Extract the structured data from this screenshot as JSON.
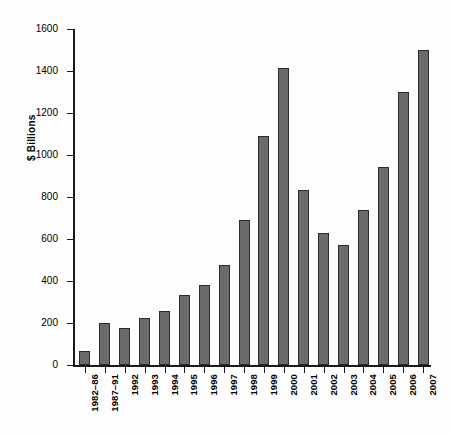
{
  "chart_data": {
    "type": "bar",
    "title": "",
    "xlabel": "",
    "ylabel": "$ Billions",
    "ylim": [
      0,
      1600
    ],
    "ytick_step": 200,
    "grid": false,
    "legend": null,
    "bar_color": "#6b6b6b",
    "bar_edge_color": "#2b2b2b",
    "yticks": [
      "0",
      "200",
      "400",
      "600",
      "800",
      "1000",
      "1200",
      "1400",
      "1600"
    ],
    "categories": [
      "1982–86",
      "1987–91",
      "1992",
      "1993",
      "1994",
      "1995",
      "1996",
      "1997",
      "1998",
      "1999",
      "2000",
      "2001",
      "2002",
      "2003",
      "2004",
      "2005",
      "2006",
      "2007"
    ],
    "values": [
      65,
      200,
      175,
      225,
      255,
      335,
      380,
      475,
      690,
      1090,
      1415,
      835,
      630,
      570,
      740,
      945,
      1300,
      1500
    ]
  }
}
